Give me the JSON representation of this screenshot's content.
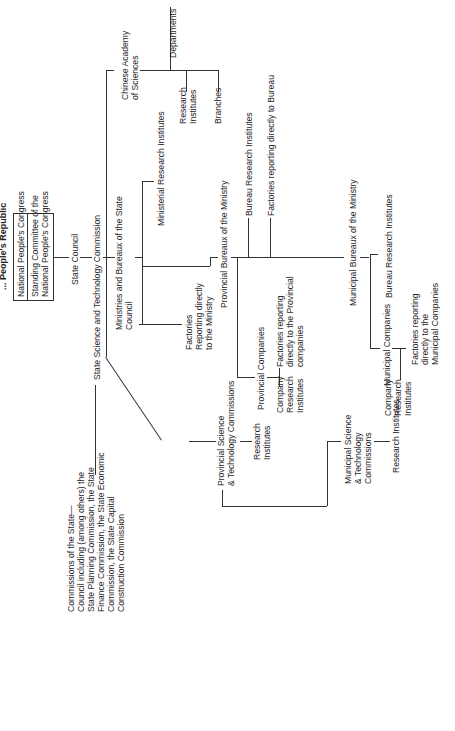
{
  "title": "... People's Republic",
  "npc_box": {
    "top": "National People's Congress",
    "bottom": "Standing Committee of the\nNational People's Congress"
  },
  "nodes": {
    "state_council": "State Council",
    "sstc": "State Science and Technology Commission",
    "ministries": "Ministries and Bureaux of the State\nCouncil",
    "commissions": "Commissions of the State—\nCouncil including (among others) the\nState Planning Commission, the State\nFinance Commission, the State Economic\nCommission, the State Capital\nConstruction Commission",
    "cas": "Chinese Academy\nof Sciences",
    "departments": "Departments",
    "cas_research": "Research\nInstitutes",
    "branches": "Branches",
    "ministerial_ri": "Ministerial Research Institutes",
    "factories_ministry": "Factories\nReporting directly\nto the Ministry",
    "provincial_bureaux": "Provincial Bureaux of the Ministry",
    "bureau_ri": "Bureau Research Institutes",
    "factories_bureau": "Factories reporting directly to Bureau",
    "provincial_companies": "Provincial Companies",
    "factories_provincial": "Factories reporting\ndirectly to the Provincial\ncompanies",
    "company_ri_prov": "Company\nResearch\nInstitutes",
    "municipal_bureaux": "Municipal Bureaux of the Ministry",
    "municipal_bureau_ri": "Bureau Research Institutes",
    "municipal_companies": "Municipal Companies",
    "factories_municipal": "Factories reporting\ndirectly to the\nMunicipal Companies",
    "company_ri_mun": "Company\nResearch\nInstitutes",
    "provincial_stc": "Provincial Science\n& Technology Commissions",
    "provincial_stc_ri": "Research\nInstitutes",
    "municipal_stc": "Municipal Science\n& Technology\nCommissions",
    "municipal_stc_ri": "Research Institutes"
  }
}
